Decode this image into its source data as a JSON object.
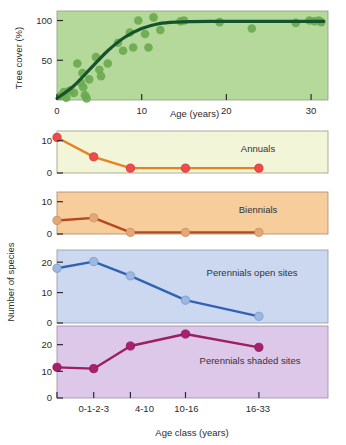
{
  "figure": {
    "width": 346,
    "height": 445,
    "background": "#ffffff"
  },
  "chart_data": [
    {
      "type": "scatter",
      "name": "tree-cover",
      "title": "",
      "xlabel": "Age (years)",
      "ylabel": "Tree cover (%)",
      "xlim": [
        0,
        32
      ],
      "ylim": [
        0,
        112
      ],
      "xticks": [
        0,
        10,
        20,
        30
      ],
      "xticklabels": [
        "0",
        "10",
        "20",
        "30"
      ],
      "yticks": [
        50,
        100
      ],
      "yticklabels": [
        "50",
        "100"
      ],
      "grid": false,
      "panel_fill": "#b5d99a",
      "point_color": "#6aa84f",
      "line_color": "#14532d",
      "points": [
        {
          "x": 0.4,
          "y": 5
        },
        {
          "x": 0.8,
          "y": 10
        },
        {
          "x": 1.1,
          "y": 3
        },
        {
          "x": 1.5,
          "y": 12
        },
        {
          "x": 2.0,
          "y": 9
        },
        {
          "x": 2.4,
          "y": 46
        },
        {
          "x": 2.8,
          "y": 22
        },
        {
          "x": 3.0,
          "y": 34
        },
        {
          "x": 3.1,
          "y": 16
        },
        {
          "x": 3.3,
          "y": 6
        },
        {
          "x": 3.5,
          "y": 2
        },
        {
          "x": 3.8,
          "y": 26
        },
        {
          "x": 4.6,
          "y": 54
        },
        {
          "x": 5.0,
          "y": 38
        },
        {
          "x": 5.2,
          "y": 30
        },
        {
          "x": 6.0,
          "y": 46
        },
        {
          "x": 7.2,
          "y": 72
        },
        {
          "x": 7.8,
          "y": 62
        },
        {
          "x": 8.6,
          "y": 85
        },
        {
          "x": 9.0,
          "y": 66
        },
        {
          "x": 9.6,
          "y": 100
        },
        {
          "x": 10.4,
          "y": 83
        },
        {
          "x": 10.8,
          "y": 66
        },
        {
          "x": 11.4,
          "y": 104
        },
        {
          "x": 12.2,
          "y": 88
        },
        {
          "x": 14.6,
          "y": 99
        },
        {
          "x": 15.0,
          "y": 100
        },
        {
          "x": 19.2,
          "y": 98
        },
        {
          "x": 23.0,
          "y": 90
        },
        {
          "x": 28.2,
          "y": 97
        },
        {
          "x": 29.8,
          "y": 100
        },
        {
          "x": 30.4,
          "y": 99
        },
        {
          "x": 30.9,
          "y": 100
        },
        {
          "x": 31.2,
          "y": 98
        }
      ],
      "fit_curve": [
        {
          "x": 0.0,
          "y": 2
        },
        {
          "x": 2.0,
          "y": 18
        },
        {
          "x": 4.0,
          "y": 40
        },
        {
          "x": 6.0,
          "y": 62
        },
        {
          "x": 8.0,
          "y": 79
        },
        {
          "x": 10.0,
          "y": 90
        },
        {
          "x": 12.0,
          "y": 96
        },
        {
          "x": 14.0,
          "y": 98
        },
        {
          "x": 18.0,
          "y": 99
        },
        {
          "x": 24.0,
          "y": 99
        },
        {
          "x": 31.5,
          "y": 99
        }
      ]
    },
    {
      "type": "line",
      "name": "annuals",
      "label": "Annuals",
      "categories": [
        "0-1-2-3",
        "4-10",
        "10-16",
        "16-33"
      ],
      "x_positions": [
        0,
        1,
        2,
        3.5,
        5.5
      ],
      "values": [
        11,
        5,
        1.5,
        1.5,
        1.5
      ],
      "ylim": [
        0,
        13
      ],
      "yticks": [
        0,
        10
      ],
      "yticklabels": [
        "0",
        "10"
      ],
      "panel_fill": "#f2f5d8",
      "line_color": "#e8821e",
      "point_color": "#ef4b4b",
      "point_edge": "#d63a3a"
    },
    {
      "type": "line",
      "name": "biennials",
      "label": "Biennials",
      "categories": [
        "0-1-2-3",
        "4-10",
        "10-16",
        "16-33"
      ],
      "x_positions": [
        0,
        1,
        2,
        3.5,
        5.5
      ],
      "values": [
        4.2,
        5.0,
        0.5,
        0.5,
        0.5
      ],
      "ylim": [
        0,
        13
      ],
      "yticks": [
        0,
        10
      ],
      "yticklabels": [
        "0",
        "10"
      ],
      "panel_fill": "#f7cd9b",
      "line_color": "#b5481c",
      "point_color": "#e3a878",
      "point_edge": "#cf9263"
    },
    {
      "type": "line",
      "name": "perennials-open-sites",
      "label": "Perennials open sites",
      "categories": [
        "0-1-2-3",
        "4-10",
        "10-16",
        "16-33"
      ],
      "x_positions": [
        0,
        1,
        2,
        3.5,
        5.5
      ],
      "values": [
        18,
        20.2,
        15.5,
        7.5,
        2.2
      ],
      "ylim": [
        0,
        24
      ],
      "yticks": [
        0,
        10,
        20
      ],
      "yticklabels": [
        "0",
        "10",
        "20"
      ],
      "panel_fill": "#ccd8f0",
      "line_color": "#2f63b5",
      "point_color": "#9cb8e0",
      "point_edge": "#7b9ccc"
    },
    {
      "type": "line",
      "name": "perennials-shaded-sites",
      "label": "Perennials shaded sites",
      "categories": [
        "0-1-2-3",
        "4-10",
        "10-16",
        "16-33"
      ],
      "x_positions": [
        0,
        1,
        2,
        3.5,
        5.5
      ],
      "values": [
        11.5,
        11.0,
        19.5,
        24.0,
        19.0
      ],
      "ylim": [
        0,
        27
      ],
      "yticks": [
        0,
        10,
        20
      ],
      "yticklabels": [
        "0",
        "10",
        "20"
      ],
      "panel_fill": "#ddc8ea",
      "line_color": "#9c1f63",
      "point_color": "#a82070",
      "point_edge": "#8e1a5c",
      "xlabel": "Age class (years)",
      "xticklabels": [
        "0-1-2-3",
        "4-10",
        "10-16",
        "16-33"
      ]
    }
  ],
  "shared": {
    "species_axis_label": "Number of species"
  }
}
